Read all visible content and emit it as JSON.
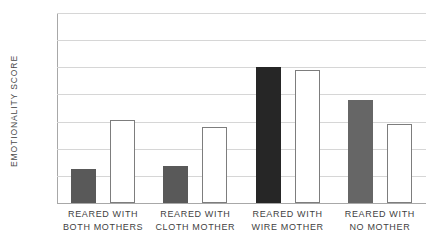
{
  "chart_data": {
    "type": "bar",
    "title": "",
    "xlabel": "",
    "ylabel": "EMOTIONALITY SCORE",
    "ylim": [
      0,
      7
    ],
    "yticks": [
      "0",
      "1",
      "2",
      "3",
      "4",
      "5",
      "6",
      "7"
    ],
    "grid": true,
    "legend": "none",
    "categories": [
      "REARED WITH BOTH MOTHERS",
      "REARED WITH CLOTH MOTHER",
      "REARED WITH WIRE MOTHER",
      "REARED WITH NO MOTHER"
    ],
    "category_lines": [
      [
        "REARED WITH",
        "BOTH MOTHERS"
      ],
      [
        "REARED WITH",
        "CLOTH MOTHER"
      ],
      [
        "REARED WITH",
        "WIRE MOTHER"
      ],
      [
        "REARED WITH",
        "NO MOTHER"
      ]
    ],
    "series": [
      {
        "name": "filled",
        "style": "solid",
        "values": [
          1.25,
          1.35,
          5.0,
          3.8
        ],
        "colors": [
          "#595959",
          "#595959",
          "#262626",
          "#666666"
        ]
      },
      {
        "name": "open",
        "style": "outline",
        "values": [
          3.05,
          2.8,
          4.9,
          2.9
        ],
        "colors": [
          "#ffffff",
          "#ffffff",
          "#ffffff",
          "#ffffff"
        ]
      }
    ],
    "colors": {
      "gridline": "#d6d6d6",
      "axis": "#a8a8a8",
      "outline": "#7d7d7d",
      "text": "#4a4a4a"
    }
  }
}
